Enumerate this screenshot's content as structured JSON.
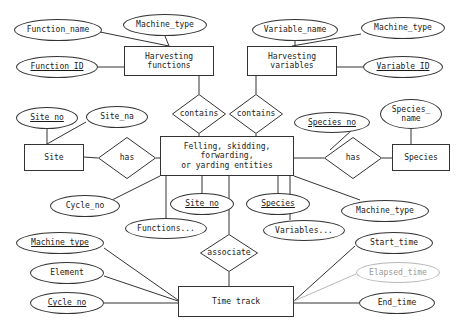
{
  "diagram": {
    "type": "entity-relationship-diagram",
    "stroke_color": "#333333",
    "derived_color": "#b9b9b9",
    "background_color": "#ffffff"
  },
  "entities": [
    {
      "id": "harvesting_functions",
      "label": "Harvesting\nfunctions",
      "x": 124,
      "y": 46,
      "w": 90,
      "h": 30
    },
    {
      "id": "harvesting_variables",
      "label": "Harvesting\nvariables",
      "x": 247,
      "y": 46,
      "w": 90,
      "h": 30
    },
    {
      "id": "site",
      "label": "Site",
      "x": 24,
      "y": 144,
      "w": 60,
      "h": 27
    },
    {
      "id": "central_entities",
      "label": "Felling, skidding,\nforwarding,\nor yarding entities",
      "x": 160,
      "y": 136,
      "w": 134,
      "h": 40
    },
    {
      "id": "species",
      "label": "Species",
      "x": 392,
      "y": 144,
      "w": 58,
      "h": 27
    },
    {
      "id": "time_track",
      "label": "Time track",
      "x": 178,
      "y": 286,
      "w": 116,
      "h": 31
    }
  ],
  "relationships": [
    {
      "id": "contains_functions",
      "label": "contains",
      "x": 172,
      "y": 94,
      "w": 54,
      "h": 40
    },
    {
      "id": "contains_variables",
      "label": "contains",
      "x": 229,
      "y": 94,
      "w": 54,
      "h": 40
    },
    {
      "id": "has_site",
      "label": "has",
      "x": 98,
      "y": 137,
      "w": 58,
      "h": 42
    },
    {
      "id": "has_species",
      "label": "has",
      "x": 324,
      "y": 137,
      "w": 58,
      "h": 42
    },
    {
      "id": "associate",
      "label": "associate",
      "x": 200,
      "y": 234,
      "w": 58,
      "h": 38
    }
  ],
  "attributes": [
    {
      "id": "function_name",
      "label": "Function_name",
      "x": 14,
      "y": 19,
      "w": 88,
      "h": 22,
      "key": false,
      "derived": false
    },
    {
      "id": "machine_type_fn",
      "label": "Machine_type",
      "x": 123,
      "y": 14,
      "w": 84,
      "h": 22,
      "key": false,
      "derived": false
    },
    {
      "id": "function_id",
      "label": "Function_ID",
      "x": 16,
      "y": 56,
      "w": 82,
      "h": 22,
      "key": true,
      "derived": false
    },
    {
      "id": "variable_name",
      "label": "Variable_name",
      "x": 252,
      "y": 19,
      "w": 86,
      "h": 22,
      "key": false,
      "derived": false
    },
    {
      "id": "machine_type_var",
      "label": "Machine_type",
      "x": 361,
      "y": 17,
      "w": 84,
      "h": 22,
      "key": false,
      "derived": false
    },
    {
      "id": "variable_id",
      "label": "Variable_ID",
      "x": 363,
      "y": 56,
      "w": 80,
      "h": 22,
      "key": true,
      "derived": false
    },
    {
      "id": "site_no_top",
      "label": "Site_no",
      "x": 16,
      "y": 107,
      "w": 62,
      "h": 22,
      "key": true,
      "derived": false
    },
    {
      "id": "site_na",
      "label": "Site_na",
      "x": 86,
      "y": 106,
      "w": 62,
      "h": 22,
      "key": false,
      "derived": false
    },
    {
      "id": "species_no",
      "label": "Species_no",
      "x": 294,
      "y": 112,
      "w": 76,
      "h": 21,
      "key": true,
      "derived": false
    },
    {
      "id": "species_name",
      "label": "Species_\nname",
      "x": 380,
      "y": 99,
      "w": 62,
      "h": 30,
      "key": false,
      "derived": false
    },
    {
      "id": "cycle_no_mid",
      "label": "Cycle_no",
      "x": 50,
      "y": 195,
      "w": 70,
      "h": 22,
      "key": false,
      "derived": false
    },
    {
      "id": "site_no_mid",
      "label": "Site_no",
      "x": 170,
      "y": 193,
      "w": 64,
      "h": 22,
      "key": true,
      "derived": false
    },
    {
      "id": "species_mid",
      "label": "Species",
      "x": 246,
      "y": 193,
      "w": 64,
      "h": 22,
      "key": true,
      "derived": false
    },
    {
      "id": "machine_type_mid",
      "label": "Machine_type",
      "x": 341,
      "y": 200,
      "w": 88,
      "h": 22,
      "key": false,
      "derived": false
    },
    {
      "id": "functions_list",
      "label": "Functions...",
      "x": 125,
      "y": 218,
      "w": 82,
      "h": 21,
      "key": false,
      "derived": false
    },
    {
      "id": "variables_list",
      "label": "Variables...",
      "x": 263,
      "y": 220,
      "w": 82,
      "h": 21,
      "key": false,
      "derived": false
    },
    {
      "id": "machine_type_tt",
      "label": "Machine_type",
      "x": 16,
      "y": 232,
      "w": 88,
      "h": 22,
      "key": true,
      "derived": false
    },
    {
      "id": "element",
      "label": "Element",
      "x": 30,
      "y": 262,
      "w": 74,
      "h": 22,
      "key": false,
      "derived": false
    },
    {
      "id": "cycle_no_tt",
      "label": "Cycle_no",
      "x": 30,
      "y": 292,
      "w": 74,
      "h": 22,
      "key": true,
      "derived": false
    },
    {
      "id": "start_time",
      "label": "Start_time",
      "x": 355,
      "y": 232,
      "w": 78,
      "h": 22,
      "key": false,
      "derived": false
    },
    {
      "id": "elapsed_time",
      "label": "Elapsed_time",
      "x": 356,
      "y": 262,
      "w": 84,
      "h": 21,
      "key": false,
      "derived": true
    },
    {
      "id": "end_time",
      "label": "End_time",
      "x": 359,
      "y": 292,
      "w": 76,
      "h": 22,
      "key": false,
      "derived": false
    }
  ],
  "edges": [
    {
      "from": "function_name",
      "to": "harvesting_functions",
      "x1": 100,
      "y1": 32,
      "x2": 169,
      "y2": 46
    },
    {
      "from": "machine_type_fn",
      "to": "harvesting_functions",
      "x1": 165,
      "y1": 36,
      "x2": 169,
      "y2": 46
    },
    {
      "from": "function_id",
      "to": "harvesting_functions",
      "x1": 98,
      "y1": 67,
      "x2": 124,
      "y2": 67
    },
    {
      "from": "harvesting_functions",
      "to": "contains_functions",
      "x1": 199,
      "y1": 76,
      "x2": 199,
      "y2": 94
    },
    {
      "from": "contains_functions",
      "to": "central_entities",
      "x1": 199,
      "y1": 134,
      "x2": 199,
      "y2": 136
    },
    {
      "from": "variable_name",
      "to": "harvesting_variables",
      "x1": 295,
      "y1": 41,
      "x2": 295,
      "y2": 46
    },
    {
      "from": "machine_type_var",
      "to": "harvesting_variables",
      "x1": 361,
      "y1": 34,
      "x2": 292,
      "y2": 46
    },
    {
      "from": "variable_id",
      "to": "harvesting_variables",
      "x1": 363,
      "y1": 67,
      "x2": 337,
      "y2": 67
    },
    {
      "from": "harvesting_variables",
      "to": "contains_variables",
      "x1": 256,
      "y1": 76,
      "x2": 256,
      "y2": 94
    },
    {
      "from": "contains_variables",
      "to": "central_entities",
      "x1": 256,
      "y1": 134,
      "x2": 256,
      "y2": 136
    },
    {
      "from": "site_no_top",
      "to": "site",
      "x1": 47,
      "y1": 129,
      "x2": 47,
      "y2": 144
    },
    {
      "from": "site_na",
      "to": "site",
      "x1": 86,
      "y1": 122,
      "x2": 47,
      "y2": 144
    },
    {
      "from": "site",
      "to": "has_site",
      "x1": 84,
      "y1": 157,
      "x2": 98,
      "y2": 158
    },
    {
      "from": "has_site",
      "to": "central_entities",
      "x1": 156,
      "y1": 158,
      "x2": 160,
      "y2": 158
    },
    {
      "from": "species_no",
      "to": "has_species",
      "x1": 352,
      "y1": 130,
      "x2": 330,
      "y2": 150
    },
    {
      "from": "species_name",
      "to": "species",
      "x1": 411,
      "y1": 129,
      "x2": 411,
      "y2": 144
    },
    {
      "from": "has_species",
      "to": "species",
      "x1": 382,
      "y1": 158,
      "x2": 392,
      "y2": 158
    },
    {
      "from": "central_entities",
      "to": "has_species",
      "x1": 294,
      "y1": 158,
      "x2": 324,
      "y2": 158
    },
    {
      "from": "central_entities",
      "to": "cycle_no_mid",
      "x1": 160,
      "y1": 176,
      "x2": 110,
      "y2": 201
    },
    {
      "from": "central_entities",
      "to": "site_no_mid",
      "x1": 202,
      "y1": 176,
      "x2": 202,
      "y2": 193
    },
    {
      "from": "central_entities",
      "to": "species_mid",
      "x1": 278,
      "y1": 176,
      "x2": 278,
      "y2": 193
    },
    {
      "from": "central_entities",
      "to": "machine_type_mid",
      "x1": 294,
      "y1": 176,
      "x2": 360,
      "y2": 200
    },
    {
      "from": "central_entities",
      "to": "functions_list",
      "x1": 166,
      "y1": 176,
      "x2": 166,
      "y2": 218
    },
    {
      "from": "central_entities",
      "to": "variables_list",
      "x1": 290,
      "y1": 176,
      "x2": 290,
      "y2": 220
    },
    {
      "from": "central_entities",
      "to": "associate",
      "x1": 229,
      "y1": 176,
      "x2": 229,
      "y2": 234
    },
    {
      "from": "associate",
      "to": "time_track",
      "x1": 229,
      "y1": 272,
      "x2": 229,
      "y2": 286
    },
    {
      "from": "machine_type_tt",
      "to": "time_track",
      "x1": 104,
      "y1": 248,
      "x2": 178,
      "y2": 300
    },
    {
      "from": "element",
      "to": "time_track",
      "x1": 104,
      "y1": 276,
      "x2": 178,
      "y2": 301
    },
    {
      "from": "cycle_no_tt",
      "to": "time_track",
      "x1": 104,
      "y1": 303,
      "x2": 178,
      "y2": 303
    },
    {
      "from": "start_time",
      "to": "time_track",
      "x1": 355,
      "y1": 246,
      "x2": 294,
      "y2": 301
    },
    {
      "from": "elapsed_time",
      "to": "time_track",
      "x1": 356,
      "y1": 274,
      "x2": 294,
      "y2": 301,
      "derived": true
    },
    {
      "from": "end_time",
      "to": "time_track",
      "x1": 359,
      "y1": 303,
      "x2": 294,
      "y2": 303
    }
  ]
}
